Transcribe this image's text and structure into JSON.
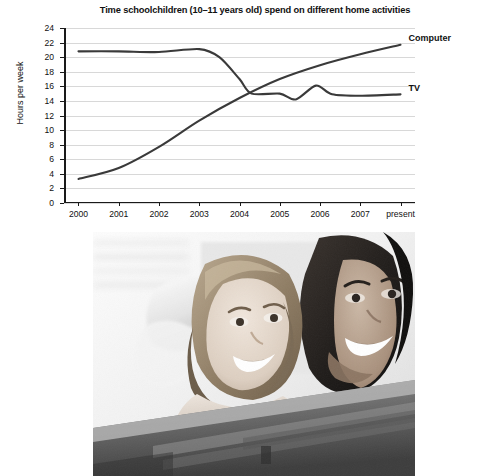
{
  "figure": {
    "photo": {
      "alt": "Black and white photograph of a girl and a woman looking at a computer screen",
      "caption": ""
    }
  },
  "chart_data": {
    "type": "line",
    "title": "Time schoolchildren (10–11 years old) spend on different home activities",
    "xlabel": "",
    "ylabel": "Hours per week",
    "ylim": [
      0,
      24
    ],
    "yticks": [
      0,
      2,
      4,
      6,
      8,
      10,
      12,
      14,
      16,
      18,
      20,
      22,
      24
    ],
    "grid": true,
    "legend_position": "right-of-plot (inline end labels)",
    "categories": [
      "2000",
      "2001",
      "2002",
      "2003",
      "2004",
      "2005",
      "2006",
      "2007",
      "present"
    ],
    "series": [
      {
        "name": "TV",
        "color": "#3a3a3a",
        "values": [
          20.8,
          20.8,
          20.7,
          21.1,
          17.0,
          15.0,
          15.2,
          14.8,
          14.9
        ],
        "detail_points": [
          {
            "x": "2000",
            "y": 20.8
          },
          {
            "x": "2001",
            "y": 20.8
          },
          {
            "x": "2002",
            "y": 20.7
          },
          {
            "x": "2003",
            "y": 21.1
          },
          {
            "x": "2003.5",
            "y": 20.0
          },
          {
            "x": "2004",
            "y": 17.0
          },
          {
            "x": "2004.3",
            "y": 15.0
          },
          {
            "x": "2005",
            "y": 15.0
          },
          {
            "x": "2005.4",
            "y": 14.2
          },
          {
            "x": "2005.9",
            "y": 16.1
          },
          {
            "x": "2006.3",
            "y": 14.9
          },
          {
            "x": "2007",
            "y": 14.7
          },
          {
            "x": "present",
            "y": 14.9
          }
        ]
      },
      {
        "name": "Computer",
        "color": "#3a3a3a",
        "values": [
          3.3,
          4.8,
          7.7,
          11.3,
          14.4,
          17.0,
          18.9,
          20.4,
          21.7
        ],
        "detail_points": [
          {
            "x": "2000",
            "y": 3.3
          },
          {
            "x": "2001",
            "y": 4.8
          },
          {
            "x": "2002",
            "y": 7.7
          },
          {
            "x": "2003",
            "y": 11.3
          },
          {
            "x": "2004",
            "y": 14.4
          },
          {
            "x": "2005",
            "y": 17.0
          },
          {
            "x": "2006",
            "y": 18.9
          },
          {
            "x": "2007",
            "y": 20.4
          },
          {
            "x": "present",
            "y": 21.7
          }
        ]
      }
    ],
    "annotations": [
      {
        "text": "Computer",
        "attached_to": "Computer",
        "position": "end-of-line-right"
      },
      {
        "text": "TV",
        "attached_to": "TV",
        "position": "end-of-line-right"
      }
    ]
  }
}
